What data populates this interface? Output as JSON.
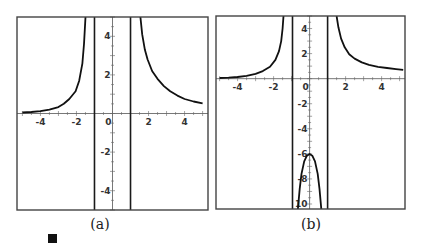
{
  "chart_data": [
    {
      "type": "line",
      "caption": "(a)",
      "title": "",
      "xlabel": "",
      "ylabel": "",
      "xlim": [
        -5.3,
        5.3
      ],
      "ylim": [
        -5,
        5
      ],
      "grid": false,
      "xticks": [
        -4,
        -2,
        0,
        2,
        4
      ],
      "xtick_labels": [
        "-4",
        "-2",
        "0",
        "2",
        "4"
      ],
      "yticks": [
        -4,
        -2,
        2,
        4
      ],
      "ytick_labels": [
        "-4",
        "-2",
        "2",
        "4"
      ],
      "vertical_asymptotes": [
        -1,
        1
      ],
      "series": [
        {
          "name": "left branch",
          "x": [
            -5.0,
            -4.5,
            -4.0,
            -3.5,
            -3.0,
            -2.7,
            -2.4,
            -2.05,
            -1.85,
            -1.67,
            -1.58,
            -1.5
          ],
          "y": [
            0.05,
            0.08,
            0.12,
            0.2,
            0.33,
            0.5,
            0.75,
            1.15,
            1.7,
            2.6,
            3.6,
            5.0
          ]
        },
        {
          "name": "right branch",
          "x": [
            1.55,
            1.65,
            1.8,
            1.95,
            2.2,
            2.5,
            2.85,
            3.2,
            3.6,
            4.0,
            4.5,
            5.0
          ],
          "y": [
            5.0,
            4.1,
            3.3,
            2.8,
            2.2,
            1.8,
            1.42,
            1.15,
            0.93,
            0.75,
            0.62,
            0.53
          ]
        }
      ]
    },
    {
      "type": "line",
      "caption": "(b)",
      "title": "",
      "xlabel": "",
      "ylabel": "",
      "xlim": [
        -5.2,
        5.3
      ],
      "ylim": [
        -10.4,
        5
      ],
      "grid": false,
      "xticks": [
        -4,
        -2,
        0,
        2,
        4
      ],
      "xtick_labels": [
        "-4",
        "-2",
        "0",
        "2",
        "4"
      ],
      "yticks": [
        -10,
        -8,
        -6,
        -4,
        -2,
        2,
        4
      ],
      "ytick_labels": [
        "10",
        "-8",
        "-6",
        "-4",
        "-2",
        "2",
        "4"
      ],
      "vertical_asymptotes": [
        -0.95,
        1.0
      ],
      "series": [
        {
          "name": "left branch",
          "x": [
            -5.0,
            -4.5,
            -4.0,
            -3.5,
            -3.0,
            -2.6,
            -2.2,
            -1.9,
            -1.7,
            -1.58,
            -1.5,
            -1.45
          ],
          "y": [
            0.05,
            0.08,
            0.13,
            0.22,
            0.38,
            0.6,
            0.95,
            1.5,
            2.2,
            3.0,
            4.0,
            5.0
          ]
        },
        {
          "name": "middle branch",
          "x": [
            -0.65,
            -0.55,
            -0.45,
            -0.3,
            -0.15,
            0.0,
            0.15,
            0.3,
            0.45,
            0.55,
            0.65
          ],
          "y": [
            -10.4,
            -8.8,
            -7.6,
            -6.6,
            -6.15,
            -6.0,
            -6.15,
            -6.6,
            -7.6,
            -8.8,
            -10.4
          ]
        },
        {
          "name": "right branch",
          "x": [
            1.5,
            1.6,
            1.75,
            1.95,
            2.2,
            2.5,
            2.9,
            3.3,
            3.8,
            4.3,
            4.8,
            5.2
          ],
          "y": [
            5.0,
            4.1,
            3.2,
            2.5,
            1.95,
            1.6,
            1.3,
            1.1,
            0.95,
            0.85,
            0.76,
            0.7
          ]
        }
      ]
    }
  ],
  "captions": {
    "a": "(a)",
    "b": "(b)"
  },
  "end_marker": "qed-square"
}
